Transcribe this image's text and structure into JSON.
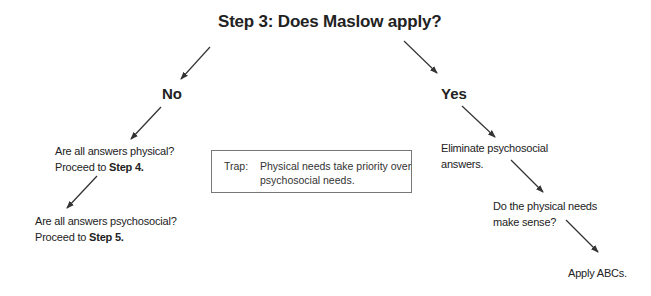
{
  "title": "Step 3:  Does Maslow apply?",
  "branches": {
    "no": {
      "label": "No",
      "steps": [
        {
          "text": "Are all answers physical?",
          "line2_prefix": "Proceed to ",
          "line2_bold": "Step 4."
        },
        {
          "text": "Are all answers psychosocial?",
          "line2_prefix": "Proceed to ",
          "line2_bold": "Step 5."
        }
      ]
    },
    "yes": {
      "label": "Yes",
      "steps": [
        {
          "line1": "Eliminate psychosocial",
          "line2": "answers."
        },
        {
          "line1": "Do the physical needs",
          "line2": "make sense?"
        },
        {
          "line1": "Apply ABCs."
        }
      ]
    }
  },
  "trap": {
    "label": "Trap:",
    "line1": "Physical needs take priority over",
    "line2": "psychosocial needs."
  }
}
